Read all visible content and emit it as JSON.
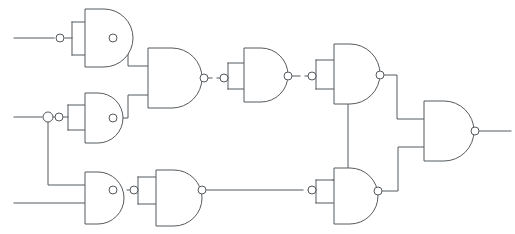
{
  "diagram": {
    "type": "logic-circuit",
    "style": {
      "background_color": "#ffffff",
      "line_color": "#555a5e",
      "gate_fill": "#ffffff",
      "line_width": 1
    },
    "canvas": {
      "width": 515,
      "height": 234
    },
    "gate_symbol": "nand",
    "counts": {
      "gates": 10,
      "inputs": 3,
      "outputs": 1,
      "inverters": 5
    },
    "inputs": [
      {
        "id": "in-a",
        "label": "",
        "x": 14,
        "y": 38,
        "length": 46
      },
      {
        "id": "in-b",
        "label": "",
        "x": 14,
        "y": 117,
        "length": 34
      },
      {
        "id": "in-c",
        "label": "",
        "x": 14,
        "y": 203,
        "length": 52
      }
    ],
    "outputs": [
      {
        "id": "out-y",
        "label": "",
        "x": 477,
        "y": 131,
        "length": 34
      }
    ],
    "gates": [
      {
        "id": "g1",
        "name": "nand-gate-1",
        "role": "inverter",
        "x": 61,
        "y": 9,
        "w": 52,
        "h": 58,
        "inputs_tied": true
      },
      {
        "id": "g2",
        "name": "nand-gate-2",
        "role": "inverter",
        "x": 61,
        "y": 93,
        "w": 52,
        "h": 50,
        "inputs_tied": true
      },
      {
        "id": "g3",
        "name": "nand-gate-3",
        "role": "nand",
        "x": 61,
        "y": 172,
        "w": 52,
        "h": 52,
        "inputs_tied": false
      },
      {
        "id": "g4",
        "name": "nand-gate-4",
        "role": "nand",
        "x": 148,
        "y": 48,
        "w": 56,
        "h": 60,
        "inputs_tied": false
      },
      {
        "id": "g5",
        "name": "nand-gate-5",
        "role": "inverter",
        "x": 234,
        "y": 48,
        "w": 54,
        "h": 54,
        "inputs_tied": true
      },
      {
        "id": "g6",
        "name": "nand-gate-6",
        "role": "inverter",
        "x": 325,
        "y": 44,
        "w": 54,
        "h": 60,
        "inputs_tied": true
      },
      {
        "id": "g8",
        "name": "nand-gate-8",
        "role": "inverter",
        "x": 148,
        "y": 170,
        "w": 54,
        "h": 56,
        "inputs_tied": true
      },
      {
        "id": "g9",
        "name": "nand-gate-9",
        "role": "inverter",
        "x": 325,
        "y": 168,
        "w": 52,
        "h": 56,
        "inputs_tied": true
      },
      {
        "id": "g10",
        "name": "nand-gate-10",
        "role": "nand",
        "x": 424,
        "y": 101,
        "w": 50,
        "h": 60,
        "inputs_tied": false
      }
    ],
    "connections": [
      {
        "id": "w1",
        "from": "in-a",
        "to": "g1",
        "name": "wire-input-a-to-gate-1"
      },
      {
        "id": "w2",
        "from": "in-b",
        "to": "g2",
        "name": "wire-input-b-to-gate-2"
      },
      {
        "id": "w3",
        "from": "in-b",
        "to": "g3",
        "name": "wire-input-b-branch-to-gate-3"
      },
      {
        "id": "w4",
        "from": "in-c",
        "to": "g3",
        "name": "wire-input-c-to-gate-3"
      },
      {
        "id": "w5",
        "from": "g1",
        "to": "g4",
        "name": "wire-gate-1-to-gate-4"
      },
      {
        "id": "w6",
        "from": "g2",
        "to": "g4",
        "name": "wire-gate-2-to-gate-4"
      },
      {
        "id": "w7",
        "from": "g4",
        "to": "g5",
        "name": "wire-gate-4-to-gate-5"
      },
      {
        "id": "w8",
        "from": "g5",
        "to": "g6",
        "name": "wire-gate-5-to-gate-6"
      },
      {
        "id": "w9",
        "from": "g3",
        "to": "g8",
        "name": "wire-gate-3-to-gate-8"
      },
      {
        "id": "w10",
        "from": "g8",
        "to": "g9",
        "name": "wire-gate-8-to-gate-9"
      },
      {
        "id": "w11",
        "from": "g6",
        "to": "g9",
        "name": "wire-gate-6-to-gate-9"
      },
      {
        "id": "w12",
        "from": "g6",
        "to": "g10",
        "name": "wire-gate-6-to-gate-10"
      },
      {
        "id": "w13",
        "from": "g9",
        "to": "g10",
        "name": "wire-gate-9-to-gate-10"
      },
      {
        "id": "w14",
        "from": "g10",
        "to": "out-y",
        "name": "wire-gate-10-to-output"
      }
    ]
  }
}
